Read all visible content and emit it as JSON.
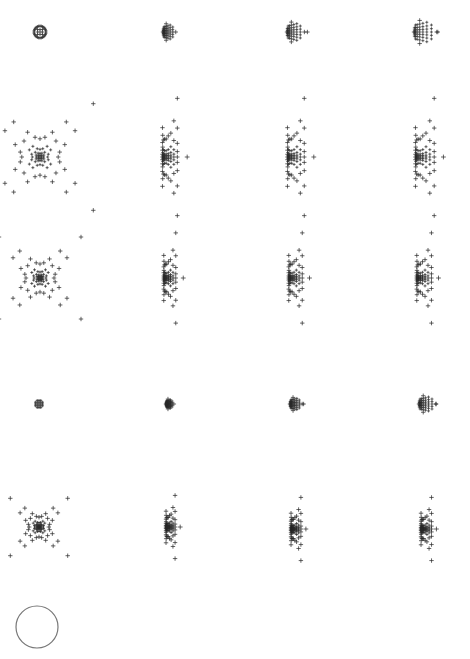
{
  "figure": {
    "width": 470,
    "height": 659,
    "background": "#ffffff",
    "marker_color": "#2a2a2a",
    "marker_glyph": "plus",
    "columns_x": [
      40,
      168,
      293,
      421
    ],
    "rows_y": [
      32,
      157,
      278,
      404,
      527
    ]
  },
  "chart_data": {
    "type": "scatter",
    "title": "",
    "panels": [
      {
        "row": 0,
        "col": 0,
        "cx": 40,
        "cy": 32,
        "scale": 7,
        "shape": "ring",
        "shift": 0.0
      },
      {
        "row": 0,
        "col": 1,
        "cx": 168,
        "cy": 32,
        "scale": 10,
        "shape": "grid-crescent",
        "shift": 0.25
      },
      {
        "row": 0,
        "col": 2,
        "cx": 293,
        "cy": 32,
        "scale": 12,
        "shape": "grid-crescent",
        "shift": 0.5
      },
      {
        "row": 0,
        "col": 3,
        "cx": 421,
        "cy": 32,
        "scale": 14,
        "shape": "grid-crescent",
        "shift": 0.75
      },
      {
        "row": 1,
        "col": 0,
        "cx": 40,
        "cy": 157,
        "scale": 13,
        "shape": "pincushion",
        "shift": 0.0
      },
      {
        "row": 1,
        "col": 1,
        "cx": 168,
        "cy": 157,
        "scale": 13,
        "shape": "pincushion",
        "shift": 0.35
      },
      {
        "row": 1,
        "col": 2,
        "cx": 293,
        "cy": 157,
        "scale": 13,
        "shape": "pincushion",
        "shift": 0.6
      },
      {
        "row": 1,
        "col": 3,
        "cx": 421,
        "cy": 157,
        "scale": 13,
        "shape": "pincushion",
        "shift": 0.85
      },
      {
        "row": 2,
        "col": 0,
        "cx": 40,
        "cy": 278,
        "scale": 10,
        "shape": "pincushion",
        "shift": 0.0
      },
      {
        "row": 2,
        "col": 1,
        "cx": 168,
        "cy": 278,
        "scale": 10,
        "shape": "pincushion",
        "shift": 0.45
      },
      {
        "row": 2,
        "col": 2,
        "cx": 293,
        "cy": 278,
        "scale": 10,
        "shape": "pincushion",
        "shift": 0.7
      },
      {
        "row": 2,
        "col": 3,
        "cx": 421,
        "cy": 278,
        "scale": 10,
        "shape": "pincushion",
        "shift": 0.9
      },
      {
        "row": 3,
        "col": 0,
        "cx": 39,
        "cy": 404,
        "scale": 4,
        "shape": "dense",
        "shift": 0.0
      },
      {
        "row": 3,
        "col": 1,
        "cx": 169,
        "cy": 404,
        "scale": 6,
        "shape": "grid-crescent",
        "shift": 0.3
      },
      {
        "row": 3,
        "col": 2,
        "cx": 294,
        "cy": 404,
        "scale": 8,
        "shape": "grid-crescent",
        "shift": 0.6
      },
      {
        "row": 3,
        "col": 3,
        "cx": 424,
        "cy": 404,
        "scale": 10,
        "shape": "grid-crescent",
        "shift": 0.85
      },
      {
        "row": 4,
        "col": 0,
        "cx": 39,
        "cy": 527,
        "scale": 7,
        "shape": "pincushion",
        "shift": 0.0
      },
      {
        "row": 4,
        "col": 1,
        "cx": 169,
        "cy": 527,
        "scale": 7,
        "shape": "pincushion",
        "shift": 0.6
      },
      {
        "row": 4,
        "col": 2,
        "cx": 294,
        "cy": 529,
        "scale": 7,
        "shape": "pincushion",
        "shift": 0.8
      },
      {
        "row": 4,
        "col": 3,
        "cx": 424,
        "cy": 529,
        "scale": 7,
        "shape": "pincushion",
        "shift": 0.95
      }
    ],
    "reference_circle": {
      "cx": 37,
      "cy": 627,
      "r": 21,
      "stroke": "#777777"
    }
  }
}
